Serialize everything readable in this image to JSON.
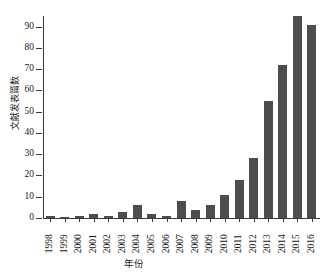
{
  "chart_data": {
    "type": "bar",
    "title": "",
    "xlabel": "年份",
    "ylabel": "文献发表篇数",
    "categories": [
      "1998",
      "1999",
      "2000",
      "2001",
      "2002",
      "2003",
      "2004",
      "2005",
      "2006",
      "2007",
      "2008",
      "2009",
      "2010",
      "2011",
      "2012",
      "2013",
      "2014",
      "2015",
      "2016"
    ],
    "values": [
      1,
      0,
      1,
      2,
      1,
      3,
      6,
      2,
      1,
      8,
      4,
      6,
      11,
      18,
      28,
      55,
      72,
      95,
      91
    ],
    "ylim": [
      0,
      95
    ],
    "ytick_labels": [
      "0",
      "10",
      "20",
      "30",
      "40",
      "50",
      "60",
      "70",
      "80",
      "90"
    ],
    "ytick_values": [
      0,
      10,
      20,
      30,
      40,
      50,
      60,
      70,
      80,
      90
    ],
    "grid": false,
    "legend": null,
    "bar_color": "#4d4d4d",
    "axis_color": "#3a3a3a"
  }
}
